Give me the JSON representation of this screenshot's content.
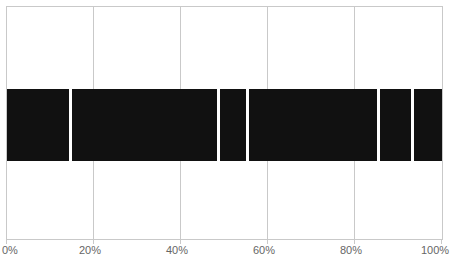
{
  "chart_data": {
    "type": "bar",
    "title": "",
    "subtitle": "",
    "xlabel": "",
    "ylabel": "",
    "orientation": "horizontal",
    "stacked": true,
    "grid": true,
    "legend": null,
    "xlim": [
      0,
      100
    ],
    "xticks": [
      0,
      20,
      40,
      60,
      80,
      100
    ],
    "xtick_labels": [
      "0%",
      "20%",
      "40%",
      "60%",
      "80%",
      "100%"
    ],
    "categories": [
      ""
    ],
    "segment_boundaries_percent": [
      0,
      14.5,
      48.7,
      55.2,
      85.5,
      93.3,
      100
    ],
    "series": [
      {
        "name": "Segment 1",
        "start": 0,
        "end": 14.5,
        "value": 14.5,
        "color": "#111111"
      },
      {
        "name": "Segment 2",
        "start": 14.5,
        "end": 48.7,
        "value": 34.2,
        "color": "#111111"
      },
      {
        "name": "Segment 3",
        "start": 48.7,
        "end": 55.2,
        "value": 6.5,
        "color": "#111111"
      },
      {
        "name": "Segment 4",
        "start": 55.2,
        "end": 85.5,
        "value": 30.3,
        "color": "#111111"
      },
      {
        "name": "Segment 5",
        "start": 85.5,
        "end": 93.3,
        "value": 7.8,
        "color": "#111111"
      },
      {
        "name": "Segment 6",
        "start": 93.3,
        "end": 100,
        "value": 6.7,
        "color": "#111111"
      }
    ],
    "colors": {
      "bar_fill": "#111111",
      "separator": "#ffffff",
      "gridline": "#c9c9c9",
      "frame": "#c9c9c9",
      "tick_label": "#666666",
      "background": "#ffffff"
    }
  },
  "axis": {
    "ticks": [
      {
        "label": "0%",
        "value": 0
      },
      {
        "label": "20%",
        "value": 20
      },
      {
        "label": "40%",
        "value": 40
      },
      {
        "label": "60%",
        "value": 60
      },
      {
        "label": "80%",
        "value": 80
      },
      {
        "label": "100%",
        "value": 100
      }
    ]
  }
}
